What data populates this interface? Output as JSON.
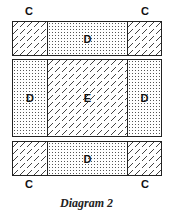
{
  "diagram": {
    "caption": "Diagram 2",
    "corner_labels": {
      "top_left": "C",
      "top_right": "C",
      "bottom_left": "C",
      "bottom_right": "C"
    },
    "top_band": {
      "left": {
        "label": "",
        "pattern": "hatch"
      },
      "center": {
        "label": "D",
        "pattern": "dots"
      },
      "right": {
        "label": "",
        "pattern": "hatch"
      }
    },
    "middle_band": {
      "left": {
        "label": "D",
        "pattern": "dots"
      },
      "center": {
        "label": "E",
        "pattern": "hatch"
      },
      "right": {
        "label": "D",
        "pattern": "dots"
      }
    },
    "bottom_band": {
      "left": {
        "label": "",
        "pattern": "hatch"
      },
      "center": {
        "label": "D",
        "pattern": "dots"
      },
      "right": {
        "label": "",
        "pattern": "hatch"
      }
    }
  }
}
